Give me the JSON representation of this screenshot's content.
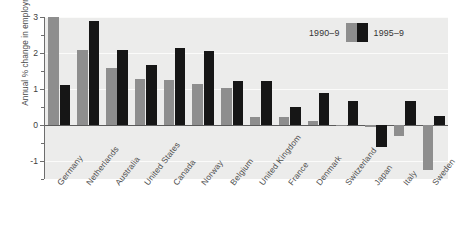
{
  "chart_data": {
    "type": "bar",
    "title": "",
    "xlabel": "",
    "ylabel": "Annual % change in employment",
    "ylim": [
      -1.5,
      3.0
    ],
    "yticks": [
      -1,
      0,
      1,
      2,
      3
    ],
    "ytick_labels": [
      "-1",
      "0",
      "1",
      "2",
      "3"
    ],
    "grid": true,
    "legend_position": "top-right",
    "categories": [
      "Germany",
      "Netherlands",
      "Australia",
      "United States",
      "Canada",
      "Norway",
      "Belgium",
      "United Kingdom",
      "France",
      "Denmark",
      "Switzerland",
      "Japan",
      "Italy",
      "Sweden"
    ],
    "series": [
      {
        "name": "1990-9",
        "color": "#8e8e8e",
        "values": [
          3.0,
          2.07,
          1.57,
          1.27,
          1.26,
          1.15,
          1.03,
          0.22,
          0.21,
          0.1,
          -0.02,
          -0.05,
          -0.3,
          -1.25
        ]
      },
      {
        "name": "1995-9",
        "color": "#161616",
        "values": [
          1.1,
          2.88,
          2.07,
          1.67,
          2.15,
          2.05,
          1.23,
          1.22,
          0.51,
          0.9,
          0.68,
          -0.6,
          0.68,
          0.26
        ]
      }
    ]
  },
  "legend": {
    "left_label": "1990–9",
    "right_label": "1995–9"
  },
  "colors": {
    "series_1990": "#8e8e8e",
    "series_1995": "#161616",
    "plot_background": "#ececeb",
    "gridline": "#fbfbfa",
    "axis": "#6d6d6d"
  }
}
